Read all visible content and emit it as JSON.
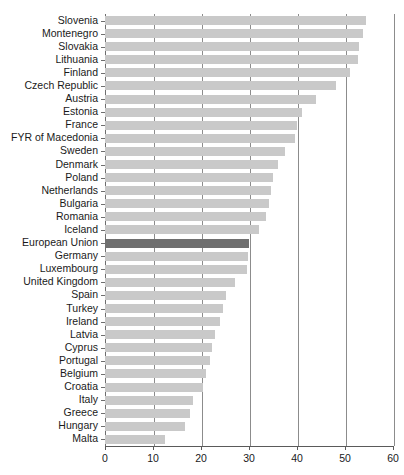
{
  "chart_data": {
    "type": "bar",
    "orientation": "horizontal",
    "title": "",
    "xlabel": "",
    "ylabel": "",
    "xlim": [
      0,
      60
    ],
    "xticks": [
      0,
      10,
      20,
      30,
      40,
      50,
      60
    ],
    "xtick_labels": [
      "0",
      "10",
      "20",
      "30",
      "40",
      "50",
      "60"
    ],
    "grid": true,
    "grid_axis": "x",
    "legend": "none",
    "bar_color": "#c9c9c9",
    "highlight_color": "#6f6f6f",
    "highlight_category": "European Union",
    "categories": [
      "Slovenia",
      "Montenegro",
      "Slovakia",
      "Lithuania",
      "Finland",
      "Czech Republic",
      "Austria",
      "Estonia",
      "France",
      "FYR of Macedonia",
      "Sweden",
      "Denmark",
      "Poland",
      "Netherlands",
      "Bulgaria",
      "Romania",
      "Iceland",
      "European Union",
      "Germany",
      "Luxembourg",
      "United Kingdom",
      "Spain",
      "Turkey",
      "Ireland",
      "Latvia",
      "Cyprus",
      "Portugal",
      "Belgium",
      "Croatia",
      "Italy",
      "Greece",
      "Hungary",
      "Malta"
    ],
    "values": [
      54.4,
      53.8,
      53.0,
      52.7,
      51.0,
      48.1,
      44.0,
      41.0,
      40.0,
      39.5,
      37.5,
      36.0,
      35.0,
      34.5,
      34.2,
      33.5,
      32.0,
      30.0,
      29.8,
      29.5,
      27.0,
      25.3,
      24.5,
      24.0,
      23.0,
      22.3,
      21.8,
      21.0,
      20.4,
      18.3,
      17.7,
      16.7,
      12.5
    ]
  },
  "axes": {
    "x_tick_labels": [
      "0",
      "10",
      "20",
      "30",
      "40",
      "50",
      "60"
    ]
  }
}
